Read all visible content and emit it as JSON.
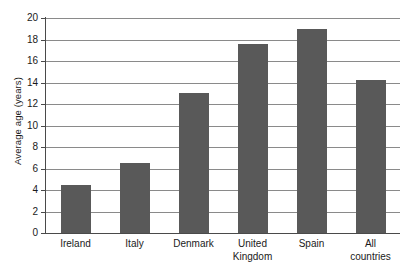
{
  "chart_data": {
    "type": "bar",
    "title": "",
    "xlabel": "",
    "ylabel": "Average age (years)",
    "categories": [
      "Ireland",
      "Italy",
      "Denmark",
      "United\nKingdom",
      "Spain",
      "All\ncountries"
    ],
    "values": [
      4.5,
      6.5,
      13.0,
      17.6,
      19.0,
      14.2
    ],
    "ylim": [
      0,
      20
    ],
    "ytick_labels": [
      "0",
      "2",
      "4",
      "6",
      "8",
      "10",
      "12",
      "14",
      "16",
      "18",
      "20"
    ],
    "ytick_values": [
      0,
      2,
      4,
      6,
      8,
      10,
      12,
      14,
      16,
      18,
      20
    ],
    "grid": true,
    "legend": "none",
    "bar_color": "#595959",
    "gridline_color": "#8a8a8a",
    "axis_color": "#4a4a4a",
    "background_color": "#ffffff"
  }
}
